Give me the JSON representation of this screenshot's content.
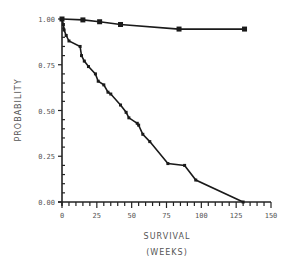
{
  "chart_data": {
    "type": "line",
    "title": "",
    "xlabel": "SURVIVAL",
    "xlabel_units": "(WEEKS)",
    "ylabel": "PROBABILITY",
    "xlim": [
      0,
      150
    ],
    "ylim": [
      0,
      1.0
    ],
    "x_ticks": [
      0,
      25,
      50,
      75,
      100,
      125,
      150
    ],
    "x_tick_labels": [
      "0",
      "25",
      "50",
      "75",
      "100",
      "125",
      "150"
    ],
    "y_ticks": [
      0,
      0.25,
      0.5,
      0.75,
      1.0
    ],
    "y_tick_labels": [
      "0.00",
      "0.25",
      "0.50",
      "0.75",
      "1.00"
    ],
    "grid": false,
    "legend": null,
    "series": [
      {
        "name": "upper",
        "marker": "square",
        "x": [
          0,
          15,
          27,
          42,
          84,
          131
        ],
        "y": [
          1.0,
          0.995,
          0.985,
          0.97,
          0.945,
          0.945
        ]
      },
      {
        "name": "lower",
        "marker": "tick",
        "x": [
          0,
          1,
          1.5,
          3,
          5,
          13,
          14,
          16,
          19,
          24,
          26,
          30,
          33,
          35,
          42,
          46,
          48,
          54,
          55,
          58,
          63,
          76,
          88,
          96,
          130
        ],
        "y": [
          1.0,
          0.97,
          0.94,
          0.91,
          0.88,
          0.85,
          0.8,
          0.77,
          0.74,
          0.7,
          0.66,
          0.64,
          0.6,
          0.59,
          0.53,
          0.49,
          0.46,
          0.43,
          0.42,
          0.37,
          0.33,
          0.21,
          0.2,
          0.12,
          0.0
        ]
      }
    ]
  }
}
